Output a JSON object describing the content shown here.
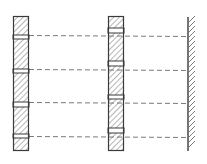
{
  "diagram": {
    "colors": {
      "background": "#ffffff",
      "stroke": "#3a3a3a",
      "hatch": "#6e6e6e",
      "dash": "#7a7a7a"
    },
    "columns": [
      {
        "name": "left-bar",
        "x": 13,
        "width": 16,
        "top": 16,
        "bottom": 151,
        "gaps": [
          [
            35,
            39
          ],
          [
            69,
            73
          ],
          [
            102,
            107
          ],
          [
            134,
            138
          ]
        ]
      },
      {
        "name": "middle-bar",
        "x": 108,
        "width": 16,
        "top": 16,
        "bottom": 151,
        "gaps": [
          [
            28,
            33
          ],
          [
            61,
            66
          ],
          [
            95,
            99
          ],
          [
            128,
            133
          ]
        ]
      }
    ],
    "dashed_lines": [
      {
        "y1": 35,
        "y2": 36
      },
      {
        "y1": 69,
        "y2": 70
      },
      {
        "y1": 102,
        "y2": 103
      },
      {
        "y1": 136,
        "y2": 137
      }
    ],
    "wall": {
      "x": 188,
      "top": 17,
      "bottom": 151,
      "hatch_width": 7
    }
  }
}
